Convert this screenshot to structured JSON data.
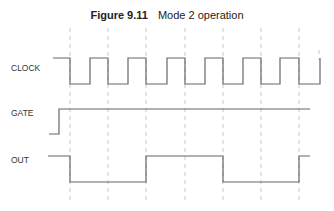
{
  "figure": {
    "number": "Figure 9.11",
    "caption": "Mode 2 operation"
  },
  "signals": [
    {
      "name": "CLOCK",
      "label_y": 68
    },
    {
      "name": "GATE",
      "label_y": 113
    },
    {
      "name": "OUT",
      "label_y": 160
    }
  ],
  "timing": {
    "dashed_lines_x": [
      70,
      108,
      146,
      185,
      223,
      261,
      299
    ],
    "clock_points": "53,58 70,58 70,84 90,84 90,58 108,58 108,84 128,84 128,58 146,58 146,84 167,84 167,58 185,58 185,84 205,84 205,58 223,58 223,84 243,84 243,58 261,58 261,84 280,84 280,58 299,58 299,84 320,84 320,58",
    "gate_points": "49,134 59,134 59,109 310,109",
    "out_points": "48,156 70,156 70,182 146,182 146,156 223,156 223,182 299,182 299,156 310,156",
    "colors": {
      "signal": "#666666",
      "dash": "#bbbbbb"
    }
  }
}
